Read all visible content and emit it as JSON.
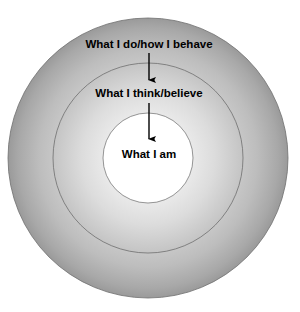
{
  "diagram": {
    "type": "concentric-circles",
    "background_color": "#ffffff",
    "geometry": {
      "center_x": 148,
      "center_y": 158,
      "outer_radius": 140,
      "middle_radius": 95,
      "inner_radius": 45
    },
    "colors": {
      "ring_edge": "#9a9a9a",
      "ring_mid": "#c2c2c2",
      "ring_inner_glow": "#f2f2f2",
      "inner_fill": "#ffffff",
      "stroke": "#6f6f6f",
      "text": "#000000",
      "arrow": "#000000"
    },
    "rings": [
      {
        "id": "outer",
        "label": "What I do/how I behave",
        "label_x": 149,
        "label_y": 45
      },
      {
        "id": "middle",
        "label": "What I think/believe",
        "label_x": 149,
        "label_y": 94
      },
      {
        "id": "inner",
        "label": "What I am",
        "label_x": 149,
        "label_y": 155
      }
    ],
    "arrows": [
      {
        "id": "arrow-outer-to-middle",
        "x": 149,
        "y_start": 53,
        "y_end": 82
      },
      {
        "id": "arrow-middle-to-inner",
        "x": 149,
        "y_start": 103,
        "y_end": 141
      }
    ]
  }
}
